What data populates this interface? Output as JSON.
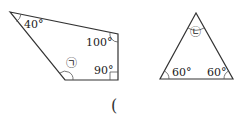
{
  "quadrilateral": {
    "angles": {
      "top_left": "40°",
      "top_right": "100°",
      "bottom_right": "90°",
      "bottom_left": "㉠"
    }
  },
  "triangle": {
    "angles": {
      "apex": "㉡",
      "bottom_left": "60°",
      "bottom_right": "60°"
    }
  },
  "answer_paren": "("
}
